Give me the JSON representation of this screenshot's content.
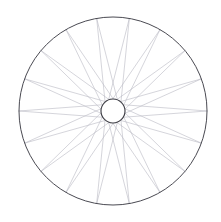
{
  "figure": {
    "background_color": "#ffffff",
    "width": 221,
    "height": 222
  },
  "chart_data": {
    "type": "diagram",
    "xlabel": "",
    "ylabel": "",
    "center": {
      "x": 113,
      "y": 111
    },
    "rim": {
      "name": "outer-rim",
      "radius": 94,
      "stroke_color": "#4a4a52",
      "stroke_width": 1,
      "fill": "none"
    },
    "hub": {
      "name": "hub",
      "radius": 12,
      "stroke_color": "#3f3f46",
      "stroke_width": 1.1,
      "fill": "#ffffff"
    },
    "spokes": {
      "count": 18,
      "pattern": "tangential",
      "tangent_radius": 12,
      "stroke_color": "#b9b9c2",
      "stroke_width": 0.6,
      "angle_step_degrees": 20,
      "lacing_offset_degrees": 140,
      "hub_angles_degrees": [
        0,
        20,
        40,
        60,
        80,
        100,
        120,
        140,
        160,
        180,
        200,
        220,
        240,
        260,
        280,
        300,
        320,
        340
      ]
    }
  }
}
